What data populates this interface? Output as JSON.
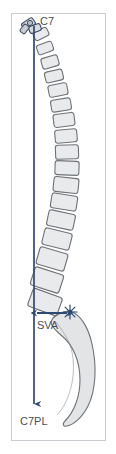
{
  "figure": {
    "background_color": "#ffffff",
    "frame_border_color": "#c9ccd1",
    "plumb_line_color": "#2e4a72",
    "vertebra_fill_color": "#e9eaec",
    "vertebra_stroke_color": "#6d7277",
    "sacrum_fill_color": "#e3e4e6",
    "label_color": "#4a4f57",
    "arrow_color": "#2e4a72"
  },
  "labels": {
    "c7": "C7",
    "sva": "SVA",
    "c7pl": "C7PL"
  },
  "annotations": {
    "c7_marker_name": "c7-vertebra-marker",
    "starburst_name": "sacral-endplate-marker",
    "plumb_line_name": "c7-plumb-line",
    "sva_measure_name": "sva-double-arrow"
  },
  "geometry": {
    "plumb_line_x": 34,
    "plumb_line_top_y": 26,
    "plumb_line_bottom_y": 404,
    "sva_arrow_y": 313,
    "sva_arrow_x_start": 36,
    "sva_arrow_x_end": 68,
    "starburst_x": 70,
    "starburst_y": 312
  },
  "vertebrae": [
    {
      "cx": 41,
      "cy": 34,
      "w": 15,
      "h": 9,
      "rot": -26
    },
    {
      "cx": 45,
      "cy": 48,
      "w": 16,
      "h": 10,
      "rot": -20
    },
    {
      "cx": 50,
      "cy": 62,
      "w": 17,
      "h": 11,
      "rot": -16
    },
    {
      "cx": 54,
      "cy": 76,
      "w": 18,
      "h": 11,
      "rot": -13
    },
    {
      "cx": 58,
      "cy": 90,
      "w": 19,
      "h": 12,
      "rot": -11
    },
    {
      "cx": 61,
      "cy": 105,
      "w": 20,
      "h": 12,
      "rot": -9
    },
    {
      "cx": 64,
      "cy": 120,
      "w": 21,
      "h": 13,
      "rot": -7
    },
    {
      "cx": 66,
      "cy": 136,
      "w": 22,
      "h": 13,
      "rot": -5
    },
    {
      "cx": 67,
      "cy": 152,
      "w": 23,
      "h": 14,
      "rot": -2
    },
    {
      "cx": 67,
      "cy": 168,
      "w": 24,
      "h": 14,
      "rot": 2
    },
    {
      "cx": 66,
      "cy": 185,
      "w": 25,
      "h": 15,
      "rot": 6
    },
    {
      "cx": 64,
      "cy": 202,
      "w": 26,
      "h": 15,
      "rot": 9
    },
    {
      "cx": 61,
      "cy": 220,
      "w": 27,
      "h": 16,
      "rot": 12
    },
    {
      "cx": 57,
      "cy": 239,
      "w": 28,
      "h": 17,
      "rot": 14
    },
    {
      "cx": 52,
      "cy": 259,
      "w": 29,
      "h": 18,
      "rot": 16
    },
    {
      "cx": 47,
      "cy": 280,
      "w": 30,
      "h": 19,
      "rot": 18
    },
    {
      "cx": 45,
      "cy": 302,
      "w": 31,
      "h": 19,
      "rot": 20
    }
  ]
}
